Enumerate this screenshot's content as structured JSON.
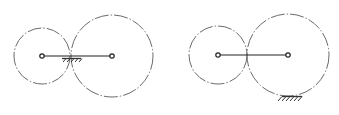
{
  "figure": {
    "panels": [
      {
        "id": "left",
        "label": "",
        "components": [
          "small-gear-pitch-circle",
          "large-gear-pitch-circle",
          "carrier-arm",
          "pivot-left",
          "pivot-right",
          "ground-hatch-at-contact"
        ],
        "ground_location": "at-gear-contact-point-below-arm"
      },
      {
        "id": "right",
        "label": "",
        "components": [
          "small-gear-pitch-circle",
          "large-gear-pitch-circle",
          "carrier-arm",
          "pivot-left",
          "pivot-right",
          "ground-hatch-under-large-gear"
        ],
        "ground_location": "bottom-of-large-gear"
      }
    ],
    "colors": {
      "circle": "#6b6b6b",
      "line": "#222222",
      "background": "#ffffff"
    }
  }
}
